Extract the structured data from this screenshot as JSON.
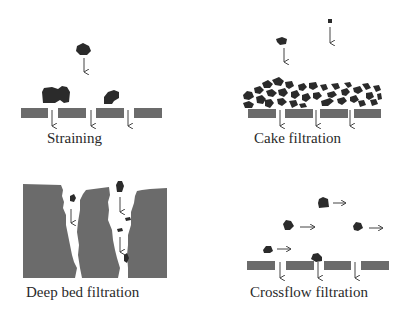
{
  "panels": [
    {
      "id": "straining",
      "label": "Straining"
    },
    {
      "id": "cake",
      "label": "Cake filtration"
    },
    {
      "id": "deepbed",
      "label": "Deep bed filtration"
    },
    {
      "id": "crossflow",
      "label": "Crossflow filtration"
    }
  ],
  "colors": {
    "medium": "#6b6b6b",
    "particle": "#2b2b2b",
    "arrow": "#444444",
    "text": "#2a2a2a"
  }
}
